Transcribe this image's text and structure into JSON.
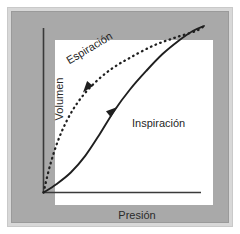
{
  "figure": {
    "kind": "pressure-volume-hysteresis-loop",
    "panel_color": "#a9a9a9",
    "frame_color": "#d8d8d8",
    "plot_background": "#ffffff",
    "axis_color": "#3a3a3a",
    "curve_color": "#1f1f1f"
  },
  "axes": {
    "xlabel": "Presión",
    "ylabel": "Volumen"
  },
  "annotations": {
    "espiracion": "Espiración",
    "inspiracion": "Inspiración"
  },
  "chart_data": {
    "type": "line",
    "title": "",
    "xlabel": "Presión",
    "ylabel": "Volumen",
    "xlim": [
      0,
      1
    ],
    "ylim": [
      0,
      1
    ],
    "grid": false,
    "legend": "inline-annotations",
    "series": [
      {
        "name": "Espiración",
        "style": "dotted",
        "direction": "decreasing-toward-origin",
        "arrow_marker": {
          "x": 0.27,
          "y": 0.63,
          "points": "down-left"
        },
        "x": [
          0.0,
          0.04,
          0.09,
          0.15,
          0.22,
          0.31,
          0.42,
          0.54,
          0.68,
          0.82,
          0.95,
          1.0
        ],
        "y": [
          0.0,
          0.16,
          0.31,
          0.44,
          0.55,
          0.65,
          0.74,
          0.81,
          0.88,
          0.93,
          0.97,
          1.0
        ]
      },
      {
        "name": "Inspiración",
        "style": "solid",
        "direction": "increasing-from-origin",
        "arrow_marker": {
          "x": 0.43,
          "y": 0.49,
          "points": "up-right"
        },
        "x": [
          0.0,
          0.08,
          0.17,
          0.26,
          0.35,
          0.44,
          0.54,
          0.64,
          0.74,
          0.84,
          0.93,
          1.0
        ],
        "y": [
          0.0,
          0.05,
          0.12,
          0.22,
          0.35,
          0.49,
          0.62,
          0.73,
          0.83,
          0.91,
          0.97,
          1.0
        ]
      }
    ]
  }
}
